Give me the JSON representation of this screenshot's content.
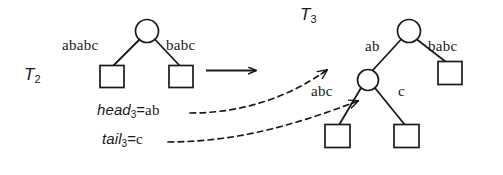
{
  "figure": {
    "caption_type": "suffix-tree-transformation",
    "stroke_color": "#1a1a1a",
    "background_color": "#ffffff"
  },
  "left_tree": {
    "name": "T",
    "name_subscript": "2",
    "root_shape": "circle",
    "edges": [
      {
        "label": "ababc",
        "child_shape": "square"
      },
      {
        "label": "babc",
        "child_shape": "square"
      }
    ]
  },
  "transform": {
    "arrow": "right-arrow"
  },
  "right_tree": {
    "name": "T",
    "name_subscript": "3",
    "root_shape": "circle",
    "edges": [
      {
        "label": "ab",
        "child_shape": "circle"
      },
      {
        "label": "babc",
        "child_shape": "square"
      }
    ],
    "inner_edges": [
      {
        "label": "abc",
        "child_shape": "square"
      },
      {
        "label": "c",
        "child_shape": "square"
      }
    ]
  },
  "annotations": [
    {
      "keyword": "head",
      "subscript": "3",
      "equals": "=",
      "value": "ab",
      "connector": "dashed-curved-arrow"
    },
    {
      "keyword": "tail",
      "subscript": "3",
      "equals": "=",
      "value": "c",
      "connector": "dashed-curved-arrow"
    }
  ]
}
